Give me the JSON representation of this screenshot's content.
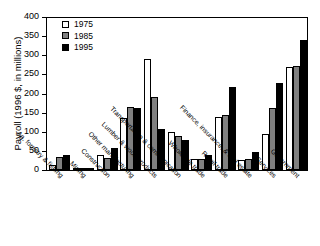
{
  "chart_data": {
    "type": "bar",
    "title": "",
    "xlabel": "",
    "ylabel": "Payroll (1996 $, in millions)",
    "ylim": [
      0,
      400
    ],
    "yticks": [
      0,
      50,
      100,
      150,
      200,
      250,
      300,
      350,
      400
    ],
    "grid": false,
    "legend_position": "top-left",
    "categories": [
      "Ag, forestry & fishing",
      "Mining",
      "Construction",
      "Other manufacturing",
      "Lumber & wood products",
      "Transportation & communication",
      "Wholesale trade",
      "Retail trade",
      "Finance, insurance, & real estate",
      "Services",
      "Government"
    ],
    "series": [
      {
        "name": "1975",
        "color": "#ffffff",
        "values": [
          12,
          3,
          40,
          137,
          290,
          100,
          28,
          138,
          25,
          95,
          270
        ]
      },
      {
        "name": "1985",
        "color": "#808080",
        "values": [
          33,
          4,
          31,
          165,
          190,
          88,
          30,
          143,
          30,
          163,
          272
        ]
      },
      {
        "name": "1995",
        "color": "#000000",
        "values": [
          39,
          3,
          58,
          163,
          108,
          78,
          38,
          218,
          48,
          228,
          340
        ]
      }
    ]
  },
  "legend": {
    "entries": [
      {
        "label": "1975",
        "swatch": "white-swatch"
      },
      {
        "label": "1985",
        "swatch": "gray-swatch"
      },
      {
        "label": "1995",
        "swatch": "black-swatch"
      }
    ]
  }
}
